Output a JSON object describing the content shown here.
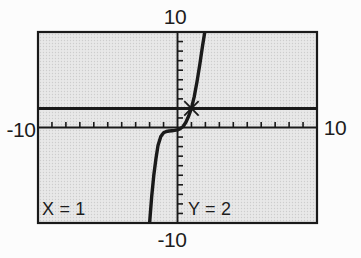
{
  "figure": {
    "background": "#fcfcfc",
    "window_fill_base": "#e8e8e8",
    "window_fill_dot": "#cdcdcd",
    "ink": "#1a1a1a",
    "text": "#1d1d1d"
  },
  "chart_data": {
    "type": "line",
    "title": "",
    "window": {
      "xmin": -10,
      "xmax": 10,
      "xscl": 1,
      "ymin": -10,
      "ymax": 10,
      "yscl": 1
    },
    "grid": false,
    "legend": false,
    "axis_tick_labels": {
      "top": "10",
      "bottom": "-10",
      "left": "-10",
      "right": "10"
    },
    "series": [
      {
        "name": "cubic-curve",
        "points": [
          [
            -2.0,
            -10.0
          ],
          [
            -1.85,
            -7.2
          ],
          [
            -1.7,
            -5.0
          ],
          [
            -1.55,
            -3.3
          ],
          [
            -1.4,
            -1.9
          ],
          [
            -1.2,
            -0.95
          ],
          [
            -1.0,
            -0.55
          ],
          [
            -0.8,
            -0.42
          ],
          [
            -0.6,
            -0.37
          ],
          [
            -0.4,
            -0.34
          ],
          [
            -0.2,
            -0.3
          ],
          [
            0.0,
            -0.25
          ],
          [
            0.2,
            -0.12
          ],
          [
            0.4,
            0.1
          ],
          [
            0.6,
            0.55
          ],
          [
            0.8,
            1.2
          ],
          [
            1.0,
            2.0
          ],
          [
            1.2,
            3.2
          ],
          [
            1.4,
            4.8
          ],
          [
            1.6,
            6.6
          ],
          [
            1.8,
            8.6
          ],
          [
            2.0,
            10.4
          ]
        ]
      },
      {
        "name": "horizontal-line-y2",
        "points": [
          [
            -10,
            2
          ],
          [
            10,
            2
          ]
        ]
      }
    ],
    "cursor": {
      "x": 1,
      "y": 2,
      "marker": "x-cross"
    },
    "readout": {
      "x_text": "X = 1",
      "y_text": "Y = 2"
    }
  }
}
